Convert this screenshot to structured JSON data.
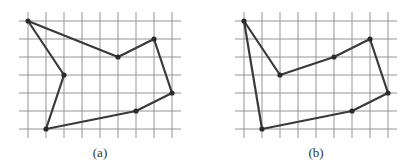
{
  "figures": [
    {
      "id": "a",
      "caption": "(a)",
      "origin": [
        28,
        21
      ],
      "cell": 18,
      "cols": 8,
      "rows": 6,
      "polygon_grid_points": [
        [
          0,
          0
        ],
        [
          5,
          2
        ],
        [
          7,
          1
        ],
        [
          8,
          4
        ],
        [
          6,
          5
        ],
        [
          1,
          6
        ],
        [
          2,
          3
        ]
      ],
      "vertex_markers": [
        [
          0,
          0
        ],
        [
          5,
          2
        ],
        [
          7,
          1
        ],
        [
          8,
          4
        ],
        [
          6,
          5
        ],
        [
          1,
          6
        ],
        [
          2,
          3
        ]
      ]
    },
    {
      "id": "b",
      "caption": "(b)",
      "origin": [
        244,
        21
      ],
      "cell": 18,
      "cols": 8,
      "rows": 6,
      "polygon_grid_points": [
        [
          0,
          0
        ],
        [
          2,
          3
        ],
        [
          5,
          2
        ],
        [
          7,
          1
        ],
        [
          8,
          4
        ],
        [
          6,
          5
        ],
        [
          1,
          6
        ]
      ],
      "vertex_markers": [
        [
          0,
          0
        ],
        [
          2,
          3
        ],
        [
          5,
          2
        ],
        [
          7,
          1
        ],
        [
          8,
          4
        ],
        [
          6,
          5
        ],
        [
          1,
          6
        ]
      ]
    }
  ],
  "colors": {
    "grid": "#8a8a8a",
    "polygon": "#3a3a3a",
    "background": "#ffffff"
  }
}
